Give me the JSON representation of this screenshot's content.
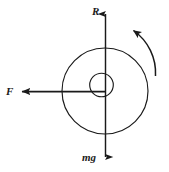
{
  "figure": {
    "type": "free-body-diagram",
    "background_color": "#ffffff",
    "stroke_color": "#1a1a1a",
    "canvas": {
      "width": 169,
      "height": 172
    }
  },
  "geometry": {
    "center": {
      "x": 105,
      "y": 91
    },
    "outer_circle_radius": 43,
    "inner_circle": {
      "cx": 101,
      "cy": 85,
      "r": 12
    },
    "vertical_axis": {
      "x": 105,
      "y_top": 10,
      "y_bottom": 161
    },
    "horizontal_axis": {
      "y": 91,
      "x_left": 19,
      "x_right": 105
    },
    "rotation_arc": {
      "start": {
        "x": 156,
        "y": 74
      },
      "end": {
        "x": 131,
        "y": 28
      },
      "radius": 51,
      "direction": "counterclockwise"
    }
  },
  "labels": {
    "normal_force": "R",
    "applied_force": "F",
    "weight": "mg"
  },
  "arrows": [
    {
      "name": "normal-force-arrow",
      "label": "R",
      "direction": "up",
      "tip": {
        "x": 105,
        "y": 10
      },
      "tail": {
        "x": 105,
        "y": 91
      }
    },
    {
      "name": "applied-force-arrow",
      "label": "F",
      "direction": "left",
      "tip": {
        "x": 19,
        "y": 91
      },
      "tail": {
        "x": 105,
        "y": 91
      }
    },
    {
      "name": "weight-arrow",
      "label": "mg",
      "direction": "down",
      "tip": {
        "x": 105,
        "y": 161
      },
      "tail": {
        "x": 105,
        "y": 91
      }
    },
    {
      "name": "rotation-arrow",
      "label": "",
      "direction": "counterclockwise",
      "tip": {
        "x": 131,
        "y": 28
      },
      "tail": {
        "x": 156,
        "y": 74
      }
    }
  ]
}
